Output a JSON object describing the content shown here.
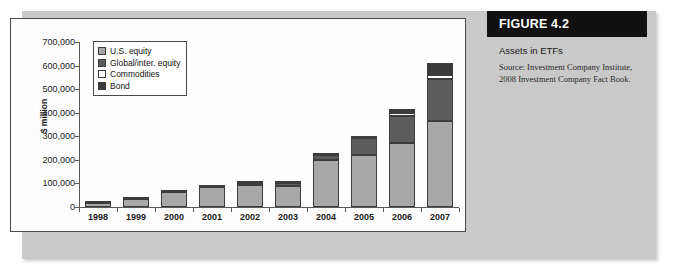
{
  "figure": {
    "header_label": "FIGURE 4.2",
    "subtitle": "Assets in ETFs",
    "source": "Source: Investment Company Institute, 2008 Investment Company Fact Book."
  },
  "colors": {
    "us_equity": "#a8a8a8",
    "global_equity": "#5c5c5c",
    "commodities": "#ffffff",
    "bond": "#3a3a3a",
    "panel_background": "#c9c9c9",
    "plot_background": "#fdfdfd",
    "header_background": "#111111",
    "axis": "#5a5a5a"
  },
  "chart_data": {
    "type": "bar",
    "stacked": true,
    "title": "Assets in ETFs",
    "xlabel": "",
    "ylabel": "$ million",
    "ylim": [
      0,
      700000
    ],
    "yticks": [
      0,
      100000,
      200000,
      300000,
      400000,
      500000,
      600000,
      700000
    ],
    "ytick_labels": [
      "0",
      "100,000",
      "200,000",
      "300,000",
      "400,000",
      "500,000",
      "600,000",
      "700,000"
    ],
    "grid": false,
    "legend_position": "upper-left",
    "categories": [
      "1998",
      "1999",
      "2000",
      "2001",
      "2002",
      "2003",
      "2004",
      "2005",
      "2006",
      "2007"
    ],
    "series": [
      {
        "name": "U.S. equity",
        "color": "#a8a8a8",
        "values": [
          15000,
          33000,
          65000,
          83000,
          95000,
          90000,
          200000,
          222000,
          270000,
          365000
        ]
      },
      {
        "name": "Global/inter. equity",
        "color": "#5c5c5c",
        "values": [
          1000,
          1500,
          2000,
          2000,
          6000,
          10000,
          22000,
          70000,
          118000,
          180000
        ]
      },
      {
        "name": "Commodities",
        "color": "#ffffff",
        "values": [
          0,
          0,
          0,
          0,
          0,
          0,
          0,
          2000,
          10000,
          17000
        ]
      },
      {
        "name": "Bond",
        "color": "#3a3a3a",
        "values": [
          0,
          0,
          0,
          0,
          2000,
          2000,
          6000,
          6000,
          17000,
          48000
        ]
      }
    ],
    "totals": [
      16000,
      34500,
      67000,
      85000,
      103000,
      102000,
      228000,
      300000,
      615000,
      610000
    ]
  },
  "legend": {
    "items": [
      {
        "label": "U.S. equity",
        "swatch": "#a8a8a8"
      },
      {
        "label": "Global/inter. equity",
        "swatch": "#5c5c5c"
      },
      {
        "label": "Commodities",
        "swatch": "#ffffff"
      },
      {
        "label": "Bond",
        "swatch": "#3a3a3a"
      }
    ]
  }
}
